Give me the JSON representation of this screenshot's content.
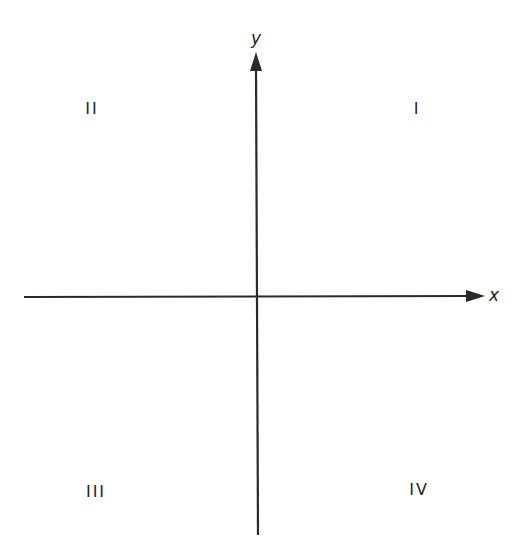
{
  "diagram": {
    "type": "cartesian-coordinate-plane",
    "colors": {
      "axis": "#2a2a2a",
      "text": "#1e1e1e",
      "background": "#ffffff"
    },
    "axes": {
      "x": {
        "label": "x"
      },
      "y": {
        "label": "y"
      }
    },
    "quadrants": [
      {
        "id": "I",
        "label": "I"
      },
      {
        "id": "II",
        "label": "II"
      },
      {
        "id": "III",
        "label": "III"
      },
      {
        "id": "IV",
        "label": "IV"
      }
    ]
  }
}
